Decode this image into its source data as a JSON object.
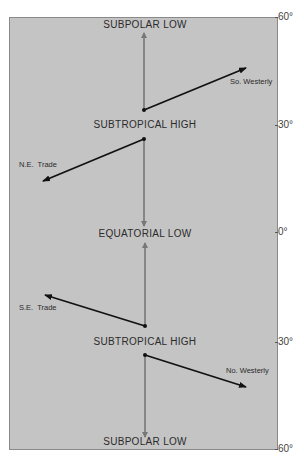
{
  "diagram": {
    "pressure_belts": [
      {
        "label": "SUBPOLAR LOW"
      },
      {
        "label": "SUBTROPICAL HIGH"
      },
      {
        "label": "EQUATORIAL LOW"
      },
      {
        "label": "SUBTROPICAL HIGH"
      },
      {
        "label": "SUBPOLAR LOW"
      }
    ],
    "winds": [
      {
        "label": "So. Westerly"
      },
      {
        "label": "N.E.  Trade"
      },
      {
        "label": "S.E.  Trade"
      },
      {
        "label": "No. Westerly"
      }
    ],
    "latitude_ticks": [
      "60°",
      "30°",
      "0°",
      "30°",
      "60°"
    ],
    "colors": {
      "background": "#c4c4c4",
      "wind_arrow": "#111111",
      "meridional_arrow": "#777777"
    }
  }
}
